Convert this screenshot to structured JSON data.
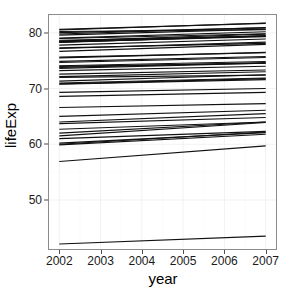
{
  "chart_data": {
    "type": "line",
    "title": "",
    "subtitle": "",
    "xlabel": "year",
    "ylabel": "lifeExp",
    "xlim": [
      2001.75,
      2007.25
    ],
    "ylim": [
      41.2,
      83.2
    ],
    "x": [
      2002,
      2007
    ],
    "x_ticks": [
      2002,
      2003,
      2004,
      2005,
      2006,
      2007
    ],
    "x_tick_labels": [
      "2002",
      "2003",
      "2004",
      "2005",
      "2006",
      "2007"
    ],
    "y_ticks": [
      50,
      60,
      70,
      80
    ],
    "y_tick_labels": [
      "50",
      "60",
      "70",
      "80"
    ],
    "grid": true,
    "grid_major_color": "#ececec",
    "grid_minor_color": "#f6f6f6",
    "panel_background": "#ffffff",
    "panel_border_color": "#8c8c8c",
    "line_color": "#111111",
    "legend": "none",
    "legend_position": "none",
    "series": [
      {
        "name": "Iceland",
        "values": [
          80.5,
          81.757
        ]
      },
      {
        "name": "Switzerland",
        "values": [
          80.62,
          81.701
        ]
      },
      {
        "name": "Spain",
        "values": [
          79.78,
          80.941
        ]
      },
      {
        "name": "Sweden",
        "values": [
          80.04,
          80.884
        ]
      },
      {
        "name": "France",
        "values": [
          79.59,
          80.657
        ]
      },
      {
        "name": "Italy",
        "values": [
          80.24,
          80.546
        ]
      },
      {
        "name": "Norway",
        "values": [
          79.05,
          80.196
        ]
      },
      {
        "name": "Austria",
        "values": [
          78.98,
          79.829
        ]
      },
      {
        "name": "Netherlands",
        "values": [
          78.53,
          79.762
        ]
      },
      {
        "name": "Belgium",
        "values": [
          78.32,
          79.441
        ]
      },
      {
        "name": "Greece",
        "values": [
          78.256,
          79.483
        ]
      },
      {
        "name": "Germany",
        "values": [
          78.67,
          79.406
        ]
      },
      {
        "name": "United Kingdom",
        "values": [
          78.471,
          79.425
        ]
      },
      {
        "name": "Finland",
        "values": [
          78.37,
          79.313
        ]
      },
      {
        "name": "Ireland",
        "values": [
          77.783,
          78.885
        ]
      },
      {
        "name": "Denmark",
        "values": [
          77.18,
          78.332
        ]
      },
      {
        "name": "Portugal",
        "values": [
          77.29,
          78.098
        ]
      },
      {
        "name": "Slovenia",
        "values": [
          76.66,
          77.926
        ]
      },
      {
        "name": "Czech Republic",
        "values": [
          75.51,
          76.486
        ]
      },
      {
        "name": "Croatia",
        "values": [
          74.876,
          75.748
        ]
      },
      {
        "name": "Poland",
        "values": [
          74.67,
          75.563
        ]
      },
      {
        "name": "Albania",
        "values": [
          75.651,
          76.423
        ]
      },
      {
        "name": "Bosnia and Herzegovina",
        "values": [
          74.09,
          74.852
        ]
      },
      {
        "name": "Slovak Republic",
        "values": [
          73.8,
          74.663
        ]
      },
      {
        "name": "Montenegro",
        "values": [
          73.981,
          74.543
        ]
      },
      {
        "name": "Serbia",
        "values": [
          73.213,
          74.002
        ]
      },
      {
        "name": "Hungary",
        "values": [
          72.59,
          73.338
        ]
      },
      {
        "name": "Bulgaria",
        "values": [
          72.14,
          73.005
        ]
      },
      {
        "name": "Romania",
        "values": [
          71.322,
          72.476
        ]
      },
      {
        "name": "Turkey",
        "values": [
          70.845,
          71.777
        ]
      },
      {
        "name": "Macedonia",
        "values": [
          73.622,
          74.543
        ]
      },
      {
        "name": "Lithuania",
        "values": [
          72.0,
          72.396
        ]
      },
      {
        "name": "Estonia",
        "values": [
          71.0,
          71.9
        ]
      },
      {
        "name": "Latvia",
        "values": [
          70.8,
          71.6
        ]
      },
      {
        "name": "Belarus",
        "values": [
          68.6,
          69.3
        ]
      },
      {
        "name": "Ukraine",
        "values": [
          69.3,
          70.0
        ]
      },
      {
        "name": "Russia",
        "values": [
          66.6,
          67.3
        ]
      },
      {
        "name": "Kazakhstan",
        "values": [
          65.0,
          66.1
        ]
      },
      {
        "name": "Uzbekistan",
        "values": [
          64.0,
          65.5
        ]
      },
      {
        "name": "Kyrgyz Republic",
        "values": [
          63.7,
          64.8
        ]
      },
      {
        "name": "Turkmenistan",
        "values": [
          62.7,
          64.0
        ]
      },
      {
        "name": "Tajikistan",
        "values": [
          62.0,
          64.0
        ]
      },
      {
        "name": "Mongolia",
        "values": [
          61.5,
          63.9
        ]
      },
      {
        "name": "Moldova",
        "values": [
          61.0,
          62.3
        ]
      },
      {
        "name": "Azerbaijan",
        "values": [
          60.2,
          62.1
        ]
      },
      {
        "name": "Armenia",
        "values": [
          60.0,
          62.2
        ]
      },
      {
        "name": "Georgia",
        "values": [
          59.9,
          61.8
        ]
      },
      {
        "name": "Afghanistan-like",
        "values": [
          56.9,
          59.7
        ]
      },
      {
        "name": "Low outlier",
        "values": [
          42.1,
          43.5
        ]
      }
    ]
  }
}
